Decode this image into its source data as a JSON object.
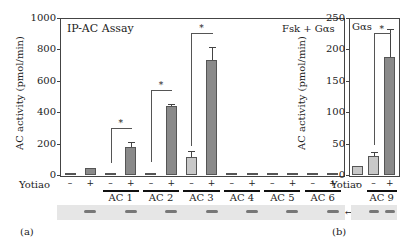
{
  "panel_a": {
    "label": "(a)",
    "title_left": "IP-AC Assay",
    "title_right": "Fsk + Gαs",
    "ylabel": "AC activity (pmol/min)",
    "yticks": [
      "0",
      "200",
      "400",
      "600",
      "800",
      "1000"
    ],
    "row_label": "Yotiao",
    "signs": [
      "–",
      "+",
      "–",
      "+",
      "–",
      "+",
      "–",
      "+",
      "–",
      "+",
      "–",
      "+",
      "–",
      "+"
    ],
    "groups": [
      "AC 1",
      "AC 2",
      "AC 3",
      "AC 4",
      "AC 5",
      "AC 6"
    ],
    "blot_label": "Yotiao",
    "star": "*"
  },
  "panel_b": {
    "label": "(b)",
    "title": "Gαs",
    "ylabel": "AC activity (pmol/min)",
    "yticks": [
      "0",
      "50",
      "100",
      "150",
      "200",
      "250"
    ],
    "row_label": "Yotiao",
    "signs": [
      "–",
      "–",
      "+"
    ],
    "groups": [
      "AC 9"
    ],
    "blot_label": "Yotiao",
    "star": "*"
  },
  "colors": {
    "bar_minus": "#c8c8c8",
    "bar_plus": "#8a8a8a",
    "axis": "#444444"
  },
  "chart_data": [
    {
      "type": "bar",
      "title": "IP-AC Assay (Fsk + Gαs)",
      "xlabel": "Yotiao",
      "ylabel": "AC activity (pmol/min)",
      "ylim": [
        0,
        1000
      ],
      "categories": [
        "Ctrl –",
        "Ctrl +",
        "AC1 –",
        "AC1 +",
        "AC2 –",
        "AC2 +",
        "AC3 –",
        "AC3 +",
        "AC4 –",
        "AC4 +",
        "AC5 –",
        "AC5 +",
        "AC6 –",
        "AC6 +"
      ],
      "values": [
        15,
        45,
        5,
        180,
        10,
        440,
        115,
        730,
        10,
        10,
        12,
        12,
        10,
        12
      ],
      "errors": [
        3,
        6,
        2,
        30,
        2,
        15,
        35,
        85,
        2,
        2,
        2,
        2,
        2,
        2
      ],
      "significance": [
        "AC1",
        "AC2",
        "AC3"
      ]
    },
    {
      "type": "bar",
      "title": "Gαs",
      "xlabel": "Yotiao",
      "ylabel": "AC activity (pmol/min)",
      "ylim": [
        0,
        250
      ],
      "categories": [
        "Ctrl –",
        "AC9 –",
        "AC9 +"
      ],
      "values": [
        14,
        31,
        188
      ],
      "errors": [
        2,
        6,
        45
      ],
      "significance": [
        "AC9"
      ]
    }
  ]
}
